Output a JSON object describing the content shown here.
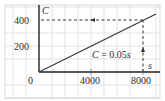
{
  "chart_data": {
    "type": "line",
    "title": "",
    "xlabel": "s",
    "ylabel": "C",
    "xlim": [
      0,
      9000
    ],
    "ylim": [
      0,
      450
    ],
    "x_ticks": [
      0,
      4000,
      8000
    ],
    "y_ticks": [
      200,
      400
    ],
    "x_tick_labels": [
      "0",
      "4000",
      "8000"
    ],
    "y_tick_labels": [
      "200",
      "400"
    ],
    "grid": true,
    "series": [
      {
        "name": "C = 0.05s",
        "equation": "C = 0.05s",
        "x": [
          0,
          4000,
          8000,
          9000
        ],
        "y": [
          0,
          200,
          400,
          450
        ]
      }
    ],
    "annotations": [
      {
        "type": "dashed-arrow",
        "from": [
          8000,
          0
        ],
        "to": [
          8000,
          400
        ],
        "direction": "up"
      },
      {
        "type": "dashed-arrow",
        "from": [
          8000,
          400
        ],
        "to": [
          0,
          400
        ],
        "direction": "left"
      }
    ],
    "legend": null
  },
  "labels": {
    "origin": "0",
    "x_tick_4000": "4000",
    "x_tick_8000": "8000",
    "y_tick_200": "200",
    "y_tick_400": "400",
    "x_axis_var": "s",
    "y_axis_var": "C",
    "equation": "C = 0.05s"
  },
  "colors": {
    "line": "#3a3a3a",
    "axis": "#2a2a2a",
    "grid": "#d8d8d8",
    "text": "#2a2a2a"
  }
}
